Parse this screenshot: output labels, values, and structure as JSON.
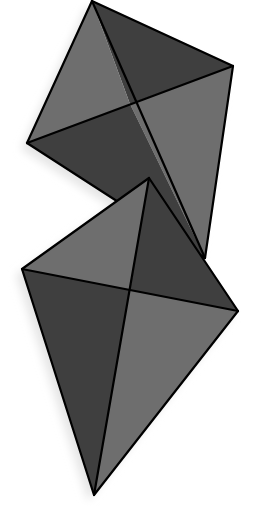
{
  "diagram": {
    "colors": {
      "background": "#ffffff",
      "light_face": "#6e6e6e",
      "dark_face": "#3f3f3f",
      "stroke": "#000000",
      "shadow": "#e6e6e6"
    },
    "kites": [
      {
        "name": "top-kite",
        "vertices": {
          "top": [
            92,
            1
          ],
          "right": [
            233,
            66
          ],
          "bottom": [
            205,
            258
          ],
          "left": [
            27,
            143
          ]
        },
        "center": [
          130,
          104
        ],
        "faces": [
          "light",
          "dark",
          "light",
          "dark"
        ]
      },
      {
        "name": "bottom-kite",
        "vertices": {
          "top": [
            149,
            178
          ],
          "right": [
            238,
            311
          ],
          "bottom": [
            94,
            495
          ],
          "left": [
            22,
            269
          ]
        },
        "center": [
          130,
          290
        ],
        "faces": [
          "light",
          "dark",
          "light",
          "dark"
        ]
      }
    ]
  }
}
